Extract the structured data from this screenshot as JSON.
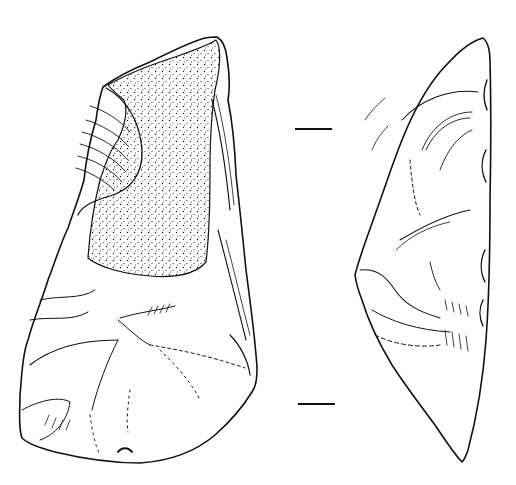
{
  "figure": {
    "type": "archaeological line drawing",
    "colors": {
      "ink": "#111111",
      "paper": "#ffffff"
    },
    "views": [
      {
        "id": "dorsal-face",
        "label": "",
        "has_cortex_stipple": true
      },
      {
        "id": "profile-view",
        "label": ""
      }
    ],
    "scale_ticks": [
      {
        "x1": 295,
        "x2": 332,
        "y": 129
      },
      {
        "x1": 298,
        "x2": 335,
        "y": 404
      }
    ]
  }
}
